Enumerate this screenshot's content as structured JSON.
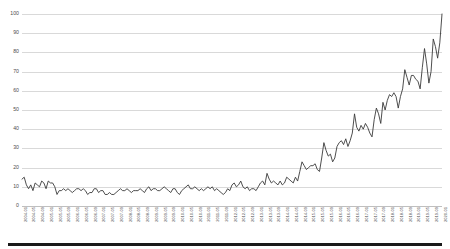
{
  "chart_data": {
    "type": "line",
    "title": "",
    "subtitle": "",
    "xlabel": "",
    "ylabel": "",
    "ylim": [
      0,
      100
    ],
    "yticks": [
      0,
      10,
      20,
      30,
      40,
      50,
      60,
      70,
      80,
      90,
      100
    ],
    "grid": true,
    "legend": false,
    "legend_position": "none",
    "line_color": "#3a3a3a",
    "gridline_color": "#d9d9d9",
    "tick_label_color": "#4d4d4d",
    "x_tick_every_n_points": 4,
    "x_tick_labels": [
      "2004-01",
      "2004-05",
      "2004-09",
      "2005-01",
      "2005-05",
      "2005-09",
      "2006-01",
      "2006-05",
      "2006-09",
      "2007-01",
      "2007-05",
      "2007-09",
      "2008-01",
      "2008-05",
      "2008-09",
      "2009-01",
      "2009-05",
      "2009-09",
      "2010-01",
      "2010-05",
      "2010-09",
      "2011-01",
      "2011-05",
      "2011-09",
      "2012-01",
      "2012-05",
      "2012-09",
      "2013-01",
      "2013-05",
      "2013-09",
      "2014-01",
      "2014-05",
      "2014-09",
      "2015-01",
      "2015-05",
      "2015-09",
      "2016-01",
      "2016-05",
      "2016-09",
      "2017-01",
      "2017-05",
      "2017-09",
      "2018-01",
      "2018-05",
      "2018-09",
      "2019-01",
      "2019-05",
      "2019-09",
      "2020-01"
    ],
    "x": [
      "2004-01",
      "2004-02",
      "2004-03",
      "2004-04",
      "2004-05",
      "2004-06",
      "2004-07",
      "2004-08",
      "2004-09",
      "2004-10",
      "2004-11",
      "2004-12",
      "2005-01",
      "2005-02",
      "2005-03",
      "2005-04",
      "2005-05",
      "2005-06",
      "2005-07",
      "2005-08",
      "2005-09",
      "2005-10",
      "2005-11",
      "2005-12",
      "2006-01",
      "2006-02",
      "2006-03",
      "2006-04",
      "2006-05",
      "2006-06",
      "2006-07",
      "2006-08",
      "2006-09",
      "2006-10",
      "2006-11",
      "2006-12",
      "2007-01",
      "2007-02",
      "2007-03",
      "2007-04",
      "2007-05",
      "2007-06",
      "2007-07",
      "2007-08",
      "2007-09",
      "2007-10",
      "2007-11",
      "2007-12",
      "2008-01",
      "2008-02",
      "2008-03",
      "2008-04",
      "2008-05",
      "2008-06",
      "2008-07",
      "2008-08",
      "2008-09",
      "2008-10",
      "2008-11",
      "2008-12",
      "2009-01",
      "2009-02",
      "2009-03",
      "2009-04",
      "2009-05",
      "2009-06",
      "2009-07",
      "2009-08",
      "2009-09",
      "2009-10",
      "2009-11",
      "2009-12",
      "2010-01",
      "2010-02",
      "2010-03",
      "2010-04",
      "2010-05",
      "2010-06",
      "2010-07",
      "2010-08",
      "2010-09",
      "2010-10",
      "2010-11",
      "2010-12",
      "2011-01",
      "2011-02",
      "2011-03",
      "2011-04",
      "2011-05",
      "2011-06",
      "2011-07",
      "2011-08",
      "2011-09",
      "2011-10",
      "2011-11",
      "2011-12",
      "2012-01",
      "2012-02",
      "2012-03",
      "2012-04",
      "2012-05",
      "2012-06",
      "2012-07",
      "2012-08",
      "2012-09",
      "2012-10",
      "2012-11",
      "2012-12",
      "2013-01",
      "2013-02",
      "2013-03",
      "2013-04",
      "2013-05",
      "2013-06",
      "2013-07",
      "2013-08",
      "2013-09",
      "2013-10",
      "2013-11",
      "2013-12",
      "2014-01",
      "2014-02",
      "2014-03",
      "2014-04",
      "2014-05",
      "2014-06",
      "2014-07",
      "2014-08",
      "2014-09",
      "2014-10",
      "2014-11",
      "2014-12",
      "2015-01",
      "2015-02",
      "2015-03",
      "2015-04",
      "2015-05",
      "2015-06",
      "2015-07",
      "2015-08",
      "2015-09",
      "2015-10",
      "2015-11",
      "2015-12",
      "2016-01",
      "2016-02",
      "2016-03",
      "2016-04",
      "2016-05",
      "2016-06",
      "2016-07",
      "2016-08",
      "2016-09",
      "2016-10",
      "2016-11",
      "2016-12",
      "2017-01",
      "2017-02",
      "2017-03",
      "2017-04",
      "2017-05",
      "2017-06",
      "2017-07",
      "2017-08",
      "2017-09",
      "2017-10",
      "2017-11",
      "2017-12",
      "2018-01",
      "2018-02",
      "2018-03",
      "2018-04",
      "2018-05",
      "2018-06",
      "2018-07",
      "2018-08",
      "2018-09",
      "2018-10",
      "2018-11",
      "2018-12",
      "2019-01",
      "2019-02",
      "2019-03",
      "2019-04",
      "2019-05",
      "2019-06",
      "2019-07",
      "2019-08",
      "2019-09",
      "2019-10",
      "2019-11",
      "2019-12",
      "2020-01"
    ],
    "values": [
      14,
      15,
      11,
      9,
      11,
      8,
      12,
      11,
      10,
      13,
      12,
      9,
      13,
      12,
      12,
      10,
      6,
      8,
      8,
      9,
      8,
      9,
      8,
      7,
      8,
      9,
      9,
      8,
      9,
      8,
      6,
      7,
      7,
      9,
      9,
      7,
      8,
      8,
      6,
      6,
      7,
      6,
      6,
      7,
      8,
      9,
      8,
      8,
      9,
      8,
      7,
      8,
      8,
      8,
      9,
      8,
      7,
      9,
      10,
      8,
      9,
      9,
      8,
      8,
      9,
      10,
      9,
      8,
      7,
      9,
      9,
      7,
      6,
      8,
      9,
      10,
      11,
      9,
      9,
      10,
      9,
      8,
      9,
      8,
      9,
      10,
      9,
      10,
      8,
      9,
      8,
      7,
      6,
      7,
      9,
      8,
      11,
      12,
      10,
      11,
      13,
      10,
      9,
      10,
      8,
      9,
      9,
      8,
      10,
      12,
      13,
      11,
      17,
      14,
      12,
      13,
      12,
      11,
      13,
      11,
      12,
      15,
      14,
      13,
      12,
      15,
      13,
      18,
      23,
      21,
      19,
      20,
      21,
      21,
      22,
      19,
      18,
      25,
      33,
      29,
      26,
      27,
      23,
      25,
      31,
      33,
      34,
      32,
      35,
      31,
      34,
      38,
      48,
      41,
      39,
      42,
      40,
      43,
      41,
      38,
      36,
      45,
      51,
      48,
      43,
      54,
      50,
      55,
      58,
      57,
      59,
      57,
      51,
      57,
      61,
      71,
      67,
      63,
      68,
      68,
      66,
      65,
      61,
      72,
      82,
      74,
      64,
      70,
      87,
      83,
      77,
      85,
      100
    ],
    "values_note": "Monthly index, 0-100 scale, strong seasonal sawtooth with rising trend",
    "y_min_observed": 6,
    "y_max_observed": 100,
    "last_value": 93
  },
  "axis": {
    "y_tick_labels": [
      "100",
      "90",
      "80",
      "70",
      "60",
      "50",
      "40",
      "30",
      "20",
      "10",
      "0"
    ]
  }
}
